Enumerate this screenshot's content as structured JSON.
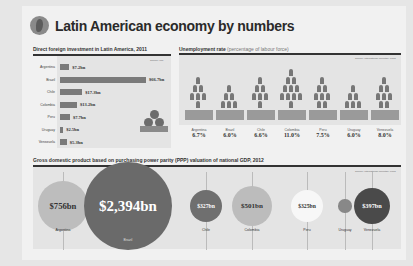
{
  "title": "Latin American economy by numbers",
  "sections": {
    "fdi": {
      "title": "Direct foreign investment in Latin America, 2011",
      "source": "Source: IMF"
    },
    "unemployment": {
      "title": "Unemployment rate",
      "subtitle": "(percentage of labour force)",
      "source": "Source: International Monetary Fund"
    },
    "gdp": {
      "title": "Gross domestic product based on purchasing power parity (PPP) valuation of national GDP, 2012",
      "source": "Source: International Monetary Fund"
    }
  },
  "chart_data": [
    {
      "type": "bar",
      "title": "Direct foreign investment in Latin America, 2011",
      "categories": [
        "Argentina",
        "Brazil",
        "Chile",
        "Colombia",
        "Peru",
        "Uruguay",
        "Venezuela"
      ],
      "values": [
        7.2,
        66.7,
        17.3,
        13.2,
        7.7,
        2.5,
        5.3
      ],
      "labels": [
        "$7.2bn",
        "$66.7bn",
        "$17.3bn",
        "$13.2bn",
        "$7.7bn",
        "$2.5bn",
        "$5.3bn"
      ],
      "unit": "USD bn",
      "orientation": "horizontal"
    },
    {
      "type": "bar",
      "title": "Unemployment rate",
      "subtitle": "(percentage of labour force)",
      "categories": [
        "Argentina",
        "Brazil",
        "Chile",
        "Colombia",
        "Peru",
        "Uruguay",
        "Venezuela"
      ],
      "values": [
        6.7,
        6.0,
        6.6,
        11.0,
        7.5,
        6.0,
        8.0
      ],
      "labels": [
        "6.7%",
        "6.0%",
        "6.6%",
        "11.0%",
        "7.5%",
        "6.0%",
        "8.0%"
      ],
      "unit": "%"
    },
    {
      "type": "bubble",
      "title": "Gross domestic product based on purchasing power parity (PPP) valuation of national GDP, 2012",
      "categories": [
        "Argentina",
        "Brazil",
        "Chile",
        "Colombia",
        "Peru",
        "Uruguay",
        "Venezuela"
      ],
      "values": [
        756,
        2394,
        327,
        501,
        325,
        55,
        397
      ],
      "labels": [
        "$756bn",
        "$2,394bn",
        "$327bn",
        "$501bn",
        "$325bn",
        "",
        "$397bn"
      ],
      "unit": "USD bn"
    }
  ]
}
